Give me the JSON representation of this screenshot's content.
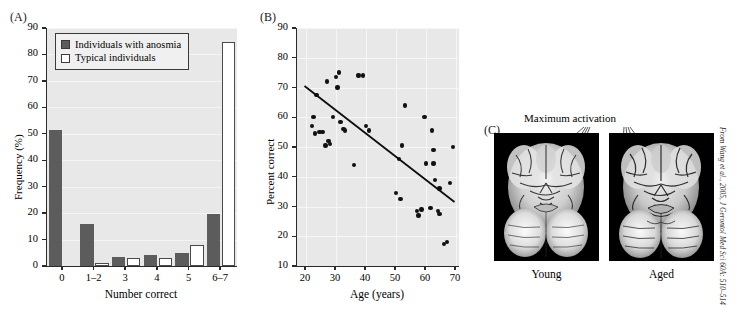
{
  "figure": {
    "citation": "From Wang et al., 2005, J Gerontol Med Sci 60A: 510–514"
  },
  "panelA": {
    "letter": "(A)",
    "legend": {
      "series_filled_label": "Individuals with anosmia",
      "series_open_label": "Typical individuals",
      "filled_color": "#5c5c5c",
      "open_color": "#ffffff"
    },
    "chart_data": {
      "type": "bar",
      "title": "",
      "xlabel": "Number correct",
      "ylabel": "Frequency (%)",
      "categories": [
        "0",
        "1–2",
        "3",
        "4",
        "5",
        "6–7"
      ],
      "ylim": [
        0,
        90
      ],
      "yticks": [
        0,
        10,
        20,
        30,
        40,
        50,
        60,
        70,
        80,
        90
      ],
      "grid": true,
      "legend_position": "top-left",
      "series": [
        {
          "name": "Individuals with anosmia",
          "values": [
            51.5,
            16.0,
            3.3,
            4.2,
            5.0,
            19.5
          ]
        },
        {
          "name": "Typical individuals",
          "values": [
            0,
            1.2,
            3.2,
            3.2,
            8.0,
            84.8
          ]
        }
      ]
    }
  },
  "panelB": {
    "letter": "(B)",
    "chart_data": {
      "type": "scatter",
      "title": "",
      "xlabel": "Age (years)",
      "ylabel": "Percent correct",
      "xlim": [
        17,
        71
      ],
      "ylim": [
        10,
        90
      ],
      "xticks": [
        20,
        30,
        40,
        50,
        60,
        70
      ],
      "yticks": [
        10,
        20,
        30,
        40,
        50,
        60,
        70,
        80,
        90
      ],
      "grid": true,
      "points": [
        [
          22.0,
          57.0
        ],
        [
          22.5,
          60.0
        ],
        [
          23.0,
          54.5
        ],
        [
          23.5,
          67.5
        ],
        [
          24.5,
          55.0
        ],
        [
          25.5,
          55.0
        ],
        [
          26.5,
          50.5
        ],
        [
          27.0,
          72.0
        ],
        [
          27.5,
          52.0
        ],
        [
          28.0,
          51.0
        ],
        [
          29.0,
          60.0
        ],
        [
          30.0,
          73.5
        ],
        [
          30.5,
          70.0
        ],
        [
          31.0,
          75.0
        ],
        [
          31.5,
          58.5
        ],
        [
          32.5,
          56.0
        ],
        [
          33.0,
          55.5
        ],
        [
          36.0,
          44.0
        ],
        [
          37.5,
          74.0
        ],
        [
          39.0,
          74.0
        ],
        [
          40.0,
          57.0
        ],
        [
          41.0,
          55.5
        ],
        [
          50.0,
          34.5
        ],
        [
          51.0,
          46.0
        ],
        [
          51.5,
          32.5
        ],
        [
          52.0,
          50.5
        ],
        [
          53.0,
          64.0
        ],
        [
          57.0,
          28.5
        ],
        [
          57.5,
          27.0
        ],
        [
          58.5,
          29.0
        ],
        [
          59.5,
          60.0
        ],
        [
          60.0,
          44.5
        ],
        [
          61.5,
          29.5
        ],
        [
          62.0,
          55.5
        ],
        [
          62.5,
          49.0
        ],
        [
          62.5,
          44.5
        ],
        [
          63.0,
          39.0
        ],
        [
          64.0,
          28.5
        ],
        [
          64.5,
          36.0
        ],
        [
          64.5,
          27.5
        ],
        [
          66.0,
          17.5
        ],
        [
          67.0,
          18.0
        ],
        [
          68.0,
          38.0
        ],
        [
          69.0,
          50.0
        ]
      ],
      "trendline": {
        "x0": 19.5,
        "y0": 70.5,
        "x1": 69.5,
        "y1": 31.5
      }
    }
  },
  "panelC": {
    "letter": "(C)",
    "annotation_label": "Maximum activation",
    "images": [
      {
        "caption": "Young"
      },
      {
        "caption": "Aged"
      }
    ]
  }
}
